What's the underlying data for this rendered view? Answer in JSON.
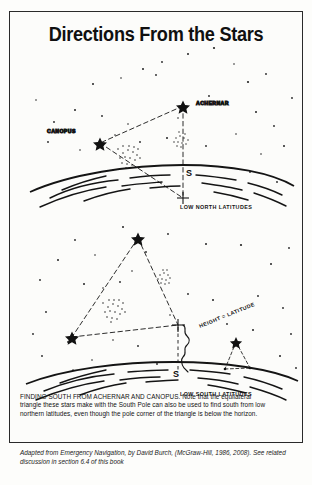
{
  "figure": {
    "title": "Directions From the Stars",
    "upper_diagram": {
      "name": "low-north-latitudes-star-chart",
      "horizon_label": "LOW NORTH LATITUDES",
      "pole_label": "S",
      "stars": [
        {
          "name": "ACHERNAR",
          "label": "ACHERNAR"
        },
        {
          "name": "CANOPUS",
          "label": "CANOPUS"
        }
      ]
    },
    "lower_diagram": {
      "name": "low-south-latitudes-star-chart",
      "horizon_label": "LOW SOUTH LATITUDES",
      "pole_label": "S",
      "height_label": "HEIGHT = LATITUDE"
    },
    "caption": [
      "FINDING SOUTH FROM ACHERNAR AND CANOPUS. Note that the equilateral",
      "triangle these stars make with the South Pole can also be used to find south from low",
      "northern latitudes, even though the pole corner of the triangle is below the horizon."
    ],
    "attribution": "Adapted from Emergency Navigation, by David Burch, (McGraw-Hill, 1986, 2008). See related discussion in section 6.4 of this book"
  },
  "colors": {
    "ink": "#151515",
    "paper": "#fcfcfa",
    "border": "#2a2a2a"
  }
}
